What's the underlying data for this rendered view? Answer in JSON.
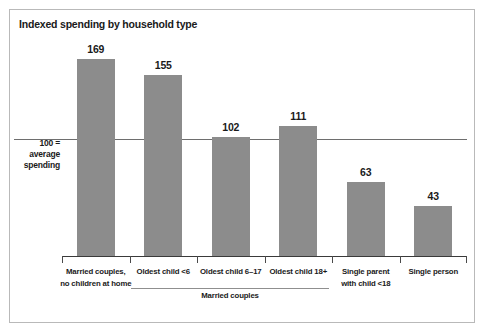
{
  "chart_data": {
    "type": "bar",
    "title": "Indexed spending by household type",
    "xlabel": "",
    "ylabel": "",
    "ylim": [
      0,
      190
    ],
    "grid": false,
    "legend": null,
    "categories": [
      "Married couples,\nno children at home",
      "Oldest child <6",
      "Oldest child 6–17",
      "Oldest child 18+",
      "Single parent\nwith child <18",
      "Single person"
    ],
    "values": [
      169,
      155,
      102,
      111,
      63,
      43
    ],
    "reference_line": {
      "value": 100,
      "label": "100 =\naverage\nspending"
    },
    "annotations": [
      {
        "text": "Married couples",
        "spans_categories": [
          1,
          2,
          3
        ]
      }
    ],
    "bar_color": "#8c8c8c"
  },
  "figure": {
    "title": "Indexed spending by household type",
    "axis_note_line1": "100 =",
    "axis_note_line2": "average",
    "axis_note_line3": "spending",
    "group_label": "Married couples",
    "categories": [
      {
        "line1": "Married couples,",
        "line2": "no children at home"
      },
      {
        "line1": "Oldest child <6",
        "line2": ""
      },
      {
        "line1": "Oldest child 6–17",
        "line2": ""
      },
      {
        "line1": "Oldest child 18+",
        "line2": ""
      },
      {
        "line1": "Single parent",
        "line2": "with child <18"
      },
      {
        "line1": "Single person",
        "line2": ""
      }
    ],
    "values": [
      "169",
      "155",
      "102",
      "111",
      "63",
      "43"
    ]
  }
}
